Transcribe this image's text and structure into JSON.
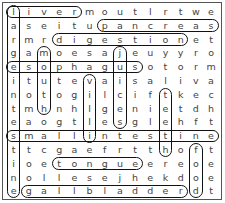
{
  "puzzle": {
    "type": "word-search",
    "rows": 14,
    "cols": 14,
    "grid": [
      [
        "l",
        "i",
        "v",
        "e",
        "r",
        "m",
        "o",
        "u",
        "t",
        "l",
        "r",
        "t",
        "w",
        "e"
      ],
      [
        "a",
        "s",
        "e",
        "i",
        "t",
        "u",
        "p",
        "a",
        "n",
        "c",
        "r",
        "e",
        "a",
        "s"
      ],
      [
        "r",
        "m",
        "r",
        "d",
        "i",
        "g",
        "e",
        "s",
        "t",
        "i",
        "o",
        "n",
        "e",
        "t"
      ],
      [
        "g",
        "a",
        "m",
        "o",
        "e",
        "s",
        "a",
        "j",
        "e",
        "u",
        "y",
        "y",
        "r",
        "o"
      ],
      [
        "e",
        "s",
        "o",
        "p",
        "h",
        "a",
        "g",
        "u",
        "s",
        "o",
        "t",
        "o",
        "r",
        "m"
      ],
      [
        "i",
        "t",
        "u",
        "t",
        "e",
        "v",
        "a",
        "i",
        "s",
        "a",
        "l",
        "i",
        "v",
        "a"
      ],
      [
        "n",
        "o",
        "t",
        "o",
        "g",
        "i",
        "l",
        "c",
        "i",
        "f",
        "t",
        "k",
        "e",
        "c"
      ],
      [
        "t",
        "m",
        "h",
        "n",
        "h",
        "l",
        "g",
        "e",
        "n",
        "i",
        "e",
        "t",
        "d",
        "h"
      ],
      [
        "e",
        "a",
        "o",
        "g",
        "t",
        "l",
        "e",
        "s",
        "g",
        "l",
        "e",
        "h",
        "f",
        "t"
      ],
      [
        "s",
        "m",
        "a",
        "l",
        "l",
        "i",
        "n",
        "t",
        "e",
        "s",
        "t",
        "i",
        "n",
        "e"
      ],
      [
        "t",
        "t",
        "c",
        "g",
        "a",
        "e",
        "f",
        "r",
        "t",
        "t",
        "h",
        "o",
        "f",
        "t"
      ],
      [
        "i",
        "o",
        "e",
        "t",
        "o",
        "n",
        "g",
        "u",
        "e",
        "e",
        "r",
        "e",
        "o",
        "e"
      ],
      [
        "n",
        "o",
        "l",
        "l",
        "e",
        "s",
        "e",
        "j",
        "h",
        "e",
        "k",
        "d",
        "o",
        "e"
      ],
      [
        "e",
        "g",
        "a",
        "l",
        "l",
        "b",
        "l",
        "a",
        "d",
        "d",
        "e",
        "r",
        "d",
        "t"
      ]
    ],
    "found_words": [
      {
        "word": "liver",
        "row": 0,
        "col": 0,
        "dir": "horizontal",
        "length": 5
      },
      {
        "word": "pancreas",
        "row": 1,
        "col": 6,
        "dir": "horizontal",
        "length": 8
      },
      {
        "word": "digestion",
        "row": 2,
        "col": 3,
        "dir": "horizontal",
        "length": 9
      },
      {
        "word": "esophagus",
        "row": 4,
        "col": 0,
        "dir": "horizontal",
        "length": 9
      },
      {
        "word": "small intestine",
        "row": 9,
        "col": 0,
        "dir": "horizontal",
        "length": 14
      },
      {
        "word": "tongue",
        "row": 11,
        "col": 3,
        "dir": "horizontal",
        "length": 6
      },
      {
        "word": "gallbladder",
        "row": 13,
        "col": 1,
        "dir": "horizontal",
        "length": 11
      },
      {
        "word": "large intestine",
        "row": 0,
        "col": 0,
        "dir": "vertical",
        "length": 14
      },
      {
        "word": "mouth",
        "row": 3,
        "col": 2,
        "dir": "vertical",
        "length": 5
      },
      {
        "word": "villi",
        "row": 5,
        "col": 5,
        "dir": "vertical",
        "length": 5
      },
      {
        "word": "juices",
        "row": 3,
        "col": 7,
        "dir": "vertical",
        "length": 6
      },
      {
        "word": "teeth",
        "row": 6,
        "col": 10,
        "dir": "vertical",
        "length": 5
      },
      {
        "word": "food",
        "row": 10,
        "col": 12,
        "dir": "vertical",
        "length": 4
      }
    ]
  }
}
